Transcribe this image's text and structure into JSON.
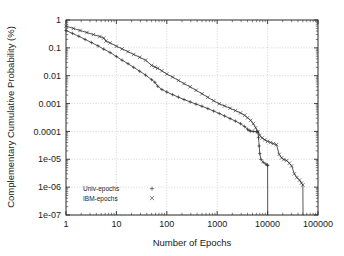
{
  "chart_data": {
    "type": "line",
    "title": "",
    "xlabel": "Number of Epochs",
    "ylabel": "Complementary Cumulative Probability (%)",
    "xscale": "log",
    "yscale": "log",
    "xlim": [
      1,
      100000
    ],
    "ylim": [
      1e-07,
      1
    ],
    "grid": true,
    "legend_position": "bottom-left-inside",
    "xticks": [
      1,
      10,
      100,
      1000,
      10000,
      100000
    ],
    "xtick_labels": [
      "1",
      "10",
      "100",
      "1000",
      "10000",
      "100000"
    ],
    "yticks": [
      1,
      0.1,
      0.01,
      0.001,
      0.0001,
      1e-05,
      1e-06,
      1e-07
    ],
    "ytick_labels": [
      "1",
      "0.1",
      "0.01",
      "0.001",
      "0.0001",
      "1e-05",
      "1e-06",
      "1e-07"
    ],
    "series": [
      {
        "name": "Univ-epochs",
        "marker": "+",
        "marker_glyph": "+",
        "color": "#3a3a3a",
        "points": [
          [
            1,
            0.42
          ],
          [
            1.35,
            0.33
          ],
          [
            1.8,
            0.26
          ],
          [
            2.4,
            0.2
          ],
          [
            3.2,
            0.155
          ],
          [
            4.3,
            0.118
          ],
          [
            5.6,
            0.09
          ],
          [
            7.5,
            0.068
          ],
          [
            10,
            0.049
          ],
          [
            13,
            0.036
          ],
          [
            17,
            0.027
          ],
          [
            22,
            0.02
          ],
          [
            29,
            0.0145
          ],
          [
            38,
            0.0105
          ],
          [
            50,
            0.0072
          ],
          [
            58,
            0.0058
          ],
          [
            66,
            0.0042
          ],
          [
            80,
            0.0032
          ],
          [
            100,
            0.0026
          ],
          [
            130,
            0.0021
          ],
          [
            170,
            0.0017
          ],
          [
            220,
            0.0014
          ],
          [
            290,
            0.00115
          ],
          [
            380,
            0.00096
          ],
          [
            500,
            0.0008
          ],
          [
            650,
            0.00066
          ],
          [
            850,
            0.00054
          ],
          [
            1100,
            0.00044
          ],
          [
            1400,
            0.00036
          ],
          [
            1800,
            0.00029
          ],
          [
            2300,
            0.000235
          ],
          [
            2900,
            0.00019
          ],
          [
            3500,
            0.00015
          ],
          [
            4000,
            0.00012
          ],
          [
            4300,
            0.000108
          ],
          [
            4600,
            0.000103
          ],
          [
            5200,
            0.0001
          ],
          [
            6000,
            9.8e-05
          ],
          [
            6400,
            9.6e-05
          ],
          [
            6600,
            6e-05
          ],
          [
            6800,
            3e-05
          ],
          [
            7000,
            1.6e-05
          ],
          [
            7400,
            9.8e-06
          ],
          [
            8200,
            7.8e-06
          ],
          [
            9200,
            6.8e-06
          ],
          [
            9900,
            6.2e-06
          ],
          [
            10000,
            6e-06
          ],
          [
            10050,
            1e-07
          ]
        ]
      },
      {
        "name": "IBM-epochs",
        "marker": "x",
        "marker_glyph": "×",
        "color": "#3a3a3a",
        "points": [
          [
            1,
            0.6
          ],
          [
            1.4,
            0.5
          ],
          [
            1.9,
            0.42
          ],
          [
            2.6,
            0.355
          ],
          [
            3.5,
            0.3
          ],
          [
            4.7,
            0.255
          ],
          [
            5.6,
            0.225
          ],
          [
            6.2,
            0.175
          ],
          [
            7.5,
            0.15
          ],
          [
            10,
            0.115
          ],
          [
            13,
            0.092
          ],
          [
            17,
            0.073
          ],
          [
            22,
            0.058
          ],
          [
            29,
            0.046
          ],
          [
            38,
            0.036
          ],
          [
            50,
            0.0235
          ],
          [
            58,
            0.0205
          ],
          [
            66,
            0.0185
          ],
          [
            80,
            0.015
          ],
          [
            100,
            0.0115
          ],
          [
            130,
            0.009
          ],
          [
            170,
            0.0068
          ],
          [
            220,
            0.0052
          ],
          [
            290,
            0.004
          ],
          [
            380,
            0.003
          ],
          [
            500,
            0.00225
          ],
          [
            650,
            0.00168
          ],
          [
            850,
            0.00126
          ],
          [
            1100,
            0.00098
          ],
          [
            1400,
            0.00082
          ],
          [
            1800,
            0.00068
          ],
          [
            2300,
            0.00056
          ],
          [
            2900,
            0.00046
          ],
          [
            3500,
            0.00038
          ],
          [
            4000,
            0.00031
          ],
          [
            4600,
            0.00025
          ],
          [
            5200,
            0.00019
          ],
          [
            5800,
            0.000135
          ],
          [
            6400,
            9.8e-05
          ],
          [
            7000,
            7.2e-05
          ],
          [
            7800,
            5.8e-05
          ],
          [
            8800,
            5e-05
          ],
          [
            10000,
            4.4e-05
          ],
          [
            11500,
            4e-05
          ],
          [
            13000,
            3.65e-05
          ],
          [
            15000,
            3.35e-05
          ],
          [
            17000,
            1.5e-05
          ],
          [
            19000,
            1.12e-05
          ],
          [
            21000,
            9.8e-06
          ],
          [
            24000,
            9e-06
          ],
          [
            27000,
            7.2e-06
          ],
          [
            30000,
            5.8e-06
          ],
          [
            34000,
            3e-06
          ],
          [
            38000,
            2.2e-06
          ],
          [
            43000,
            1.8e-06
          ],
          [
            47000,
            1.4e-06
          ],
          [
            50000,
            1.2e-06
          ],
          [
            50500,
            1e-07
          ]
        ]
      }
    ]
  },
  "legend": {
    "entries": [
      {
        "label": "Univ-epochs",
        "glyph": "+"
      },
      {
        "label": "IBM-epochs",
        "glyph": "×"
      }
    ]
  }
}
